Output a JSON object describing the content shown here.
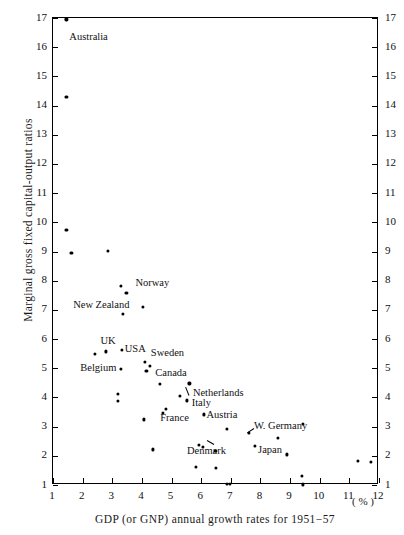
{
  "chart_data": {
    "type": "scatter",
    "title": "",
    "xlabel": "GDP (or GNP) annual growth rates for 1951−57",
    "ylabel": "Marginal gross fixed capital-output ratios",
    "x_unit": "( % )",
    "xlim": [
      1,
      12
    ],
    "ylim": [
      1,
      17
    ],
    "grid": false,
    "legend": "none",
    "x_ticks": [
      1,
      2,
      3,
      4,
      5,
      6,
      7,
      8,
      9,
      10,
      11,
      12
    ],
    "y_ticks": [
      1,
      2,
      3,
      4,
      5,
      6,
      7,
      8,
      9,
      10,
      11,
      12,
      13,
      14,
      15,
      16,
      17
    ],
    "y_ticks_right": [
      1,
      2,
      3,
      4,
      5,
      6,
      7,
      8,
      9,
      10,
      11,
      12,
      13,
      14,
      15,
      16,
      17
    ],
    "marker": "filled-circle",
    "marker_color": "#000000",
    "points": [
      {
        "x": 1.45,
        "y": 16.95,
        "label": "Australia"
      },
      {
        "x": 1.45,
        "y": 14.3,
        "label": ""
      },
      {
        "x": 1.45,
        "y": 9.75,
        "label": ""
      },
      {
        "x": 1.62,
        "y": 8.95,
        "label": ""
      },
      {
        "x": 2.85,
        "y": 9.02,
        "label": ""
      },
      {
        "x": 3.3,
        "y": 7.82,
        "label": ""
      },
      {
        "x": 3.48,
        "y": 7.58,
        "label": ""
      },
      {
        "x": 4.02,
        "y": 7.1,
        "label": "Norway"
      },
      {
        "x": 3.35,
        "y": 6.86,
        "label": ""
      },
      {
        "x": 2.42,
        "y": 5.48,
        "label": ""
      },
      {
        "x": 2.78,
        "y": 5.58,
        "label": "UK"
      },
      {
        "x": 3.32,
        "y": 5.62,
        "label": "USA"
      },
      {
        "x": 3.3,
        "y": 4.98,
        "label": "Belgium"
      },
      {
        "x": 4.1,
        "y": 5.22,
        "label": "Sweden"
      },
      {
        "x": 4.28,
        "y": 5.08,
        "label": ""
      },
      {
        "x": 4.15,
        "y": 4.92,
        "label": "Canada"
      },
      {
        "x": 3.18,
        "y": 4.12,
        "label": ""
      },
      {
        "x": 3.2,
        "y": 3.88,
        "label": ""
      },
      {
        "x": 4.6,
        "y": 4.45,
        "label": ""
      },
      {
        "x": 5.6,
        "y": 4.48,
        "label": "Netherlands"
      },
      {
        "x": 5.28,
        "y": 4.05,
        "label": ""
      },
      {
        "x": 5.52,
        "y": 3.9,
        "label": "Italy"
      },
      {
        "x": 4.82,
        "y": 3.62,
        "label": ""
      },
      {
        "x": 4.7,
        "y": 3.48,
        "label": "France"
      },
      {
        "x": 6.08,
        "y": 3.42,
        "label": "Austria"
      },
      {
        "x": 4.08,
        "y": 3.25,
        "label": ""
      },
      {
        "x": 6.88,
        "y": 2.92,
        "label": ""
      },
      {
        "x": 7.62,
        "y": 2.78,
        "label": "W. Germany"
      },
      {
        "x": 9.42,
        "y": 3.1,
        "label": ""
      },
      {
        "x": 8.58,
        "y": 2.62,
        "label": ""
      },
      {
        "x": 5.92,
        "y": 2.38,
        "label": ""
      },
      {
        "x": 6.05,
        "y": 2.3,
        "label": ""
      },
      {
        "x": 7.82,
        "y": 2.35,
        "label": "Japan"
      },
      {
        "x": 4.38,
        "y": 2.22,
        "label": ""
      },
      {
        "x": 6.48,
        "y": 2.18,
        "label": "Denmark"
      },
      {
        "x": 8.88,
        "y": 2.05,
        "label": ""
      },
      {
        "x": 11.3,
        "y": 1.82,
        "label": ""
      },
      {
        "x": 11.72,
        "y": 1.8,
        "label": ""
      },
      {
        "x": 5.82,
        "y": 1.62,
        "label": ""
      },
      {
        "x": 6.5,
        "y": 1.58,
        "label": ""
      },
      {
        "x": 9.4,
        "y": 1.32,
        "label": ""
      },
      {
        "x": 6.88,
        "y": 1.05,
        "label": ""
      },
      {
        "x": 6.98,
        "y": 1.05,
        "label": ""
      },
      {
        "x": 9.42,
        "y": 1.02,
        "label": ""
      }
    ],
    "annotations": [
      {
        "text": "Australia",
        "x": 1.55,
        "y": 16.35,
        "align": "left"
      },
      {
        "text": "Norway",
        "x": 3.78,
        "y": 7.95,
        "align": "left"
      },
      {
        "text": "New Zealand",
        "x": 1.68,
        "y": 7.18,
        "align": "left"
      },
      {
        "text": "UK",
        "x": 2.6,
        "y": 5.95,
        "align": "left"
      },
      {
        "text": "USA",
        "x": 3.42,
        "y": 5.68,
        "align": "left"
      },
      {
        "text": "Sweden",
        "x": 4.3,
        "y": 5.55,
        "align": "left"
      },
      {
        "text": "Belgium",
        "x": 1.92,
        "y": 5.02,
        "align": "left"
      },
      {
        "text": "Canada",
        "x": 4.45,
        "y": 4.85,
        "align": "left"
      },
      {
        "text": "Netherlands",
        "x": 5.72,
        "y": 4.18,
        "align": "left"
      },
      {
        "text": "Italy",
        "x": 5.68,
        "y": 3.82,
        "align": "left"
      },
      {
        "text": "France",
        "x": 4.62,
        "y": 3.3,
        "align": "left"
      },
      {
        "text": "Austria",
        "x": 6.18,
        "y": 3.42,
        "align": "left"
      },
      {
        "text": "W. Germany",
        "x": 7.78,
        "y": 3.05,
        "align": "left"
      },
      {
        "text": "Denmark",
        "x": 5.52,
        "y": 2.18,
        "align": "left"
      },
      {
        "text": "Japan",
        "x": 7.92,
        "y": 2.22,
        "align": "left"
      }
    ],
    "leaders": [
      {
        "x1": 5.6,
        "y1": 4.08,
        "x2": 5.48,
        "y2": 4.38
      },
      {
        "x1": 7.78,
        "y1": 2.95,
        "x2": 7.55,
        "y2": 2.8
      },
      {
        "x1": 6.42,
        "y1": 2.42,
        "x2": 6.2,
        "y2": 2.55
      }
    ]
  }
}
